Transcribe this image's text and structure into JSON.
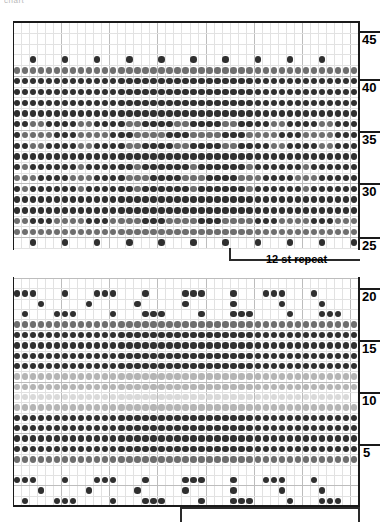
{
  "caption": {
    "text": "chart"
  },
  "colors": {
    "dark": "#2f2f2f",
    "mid": "#6e6e6e",
    "light": "#b4b4b4",
    "pale": "#d9d9d9",
    "background": "#ffffff",
    "grid_minor": "#e2e2e2",
    "grid_major": "#bdbdbd",
    "frame": "#1a1a1a"
  },
  "labels": {
    "repeat": "12 st repeat"
  },
  "row_numbers_upper": [
    "45",
    "40",
    "35",
    "30",
    "25"
  ],
  "row_numbers_lower": [
    "20",
    "15",
    "10",
    "5"
  ],
  "chart_data": {
    "type": "heatmap",
    "title": "",
    "subtitle": "",
    "xlabel": "",
    "ylabel": "",
    "legend_position": "none",
    "grid": true,
    "columns": 43,
    "panels": [
      {
        "name": "upper-chart",
        "row_range": [
          25,
          45
        ],
        "row_labels": [
          "45",
          "40",
          "35",
          "30",
          "25"
        ],
        "rows_top_to_bottom": [
          {
            "row": 45,
            "cells": "........................................."
          },
          {
            "row": 44,
            "cells": "........................................."
          },
          {
            "row": 43,
            "cells": "........................................."
          },
          {
            "row": 42,
            "cells": "..d...d...d...d...d...d...d...d...d...d..."
          },
          {
            "row": 41,
            "cells": "mmmmmmmmmmmmmmmmmmmmmmmmmmmmmmmmmmmmmmmmmmm"
          },
          {
            "row": 40,
            "cells": "ddddddddddddddddddddddddddddddddddddddddddd"
          },
          {
            "row": 39,
            "cells": "ddddddddddddddddddddddddddddddddddddddddddd"
          },
          {
            "row": 38,
            "cells": "ddddddddddddddddddddddddddddddddddddddddddd"
          },
          {
            "row": 37,
            "cells": "ddddddddddddddddddddddddddddddddddddddddddd"
          },
          {
            "row": 36,
            "cells": "ddmmddddmmddddmmddddmmddddmmddddmmddddmmddd"
          },
          {
            "row": 35,
            "cells": "dmmmmdddmmmmdddmmmmdddmmmmdddmmmmdddmmmmddd"
          },
          {
            "row": 34,
            "cells": "ddmmddddmmddddmmddddmmddddmmddddmmddddmmddd"
          },
          {
            "row": 33,
            "cells": "ddddddddddddddddddddddddddddddddddddddddddd"
          },
          {
            "row": 32,
            "cells": "dmddddddmddddddmddddddmddddddmddddddmdddddd"
          },
          {
            "row": 31,
            "cells": "mmmddddmmmddddmmmddddmmmddddmmmddddmmmddddd"
          },
          {
            "row": 30,
            "cells": "dmddddddmddddddmddddddmddddddmddddddmdddddd"
          },
          {
            "row": 29,
            "cells": "ddddddddddddddddddddddddddddddddddddddddddd"
          },
          {
            "row": 28,
            "cells": "ddddddddddddddddddddddddddddddddddddddddddd"
          },
          {
            "row": 27,
            "cells": "mmdddmmmmdddmmmmdddmmmmdddmmmmdddmmmmdddmmm"
          },
          {
            "row": 26,
            "cells": "mmmmmmmmmmmmmmmmmmmmmmmmmmmmmmmmmmmmmmmmmmm"
          },
          {
            "row": 25,
            "cells": "..d...d...d...d...d...d...d...d...d...d...d"
          }
        ]
      },
      {
        "name": "lower-chart",
        "row_range": [
          1,
          22
        ],
        "row_labels": [
          "20",
          "15",
          "10",
          "5"
        ],
        "rows_top_to_bottom": [
          {
            "row": 22,
            "cells": "..........................................."
          },
          {
            "row": 21,
            "cells": "ddd...d...ddd...d....ddd...d...ddd...d....."
          },
          {
            "row": 20,
            "cells": "...d.....d.....d.....d.....d.....d....d...."
          },
          {
            "row": 19,
            "cells": ".d...ddd....d...ddd....d...ddd....d...ddd.."
          },
          {
            "row": 18,
            "cells": "mmmmmmmmmmmmmmmmmmmmmmmmmmmmmmmmmmmmmmmmmmm"
          },
          {
            "row": 17,
            "cells": "ddddddddddddddddddddddddddddddddddddddddddd"
          },
          {
            "row": 16,
            "cells": "ddddddddddddddddddddddddddddddddddddddddddd"
          },
          {
            "row": 15,
            "cells": "ddddddddddddddddddddddddddddddddddddddddddd"
          },
          {
            "row": 14,
            "cells": "ddddddddddddddddddddddddddddddddddddddddddd"
          },
          {
            "row": 13,
            "cells": "lllllllllllllllllllllllllllllllllllllllllll"
          },
          {
            "row": 12,
            "cells": "lllllllllllllllllllllllllllllllllllllllllll"
          },
          {
            "row": 11,
            "cells": "pppppppppppppppppppppppppppppppppppppppppp p"
          },
          {
            "row": 10,
            "cells": "lllllllllllllllllllllllllllllllllllllllllll"
          },
          {
            "row": 9,
            "cells": "ddddddddddddddddddddddddddddddddddddddddddd"
          },
          {
            "row": 8,
            "cells": "ddddddddddddddddddddddddddddddddddddddddddd"
          },
          {
            "row": 7,
            "cells": "ddddddddddddddddddddddddddddddddddddddddddd"
          },
          {
            "row": 6,
            "cells": "ddddddddddddddddddddddddddddddddddddddddddd"
          },
          {
            "row": 5,
            "cells": "mmmmmmmmmmmmmmmmmmmmmmmmmmmmmmmmmmmmmmmmmmm"
          },
          {
            "row": 4,
            "cells": "..........................................."
          },
          {
            "row": 3,
            "cells": "ddd...d...ddd...d....ddd...d...ddd...d....."
          },
          {
            "row": 2,
            "cells": "...d.....d.....d.....d.....d.....d....d...."
          },
          {
            "row": 1,
            "cells": ".d...ddd....d...ddd....d...ddd....d...ddd.."
          }
        ]
      }
    ]
  }
}
